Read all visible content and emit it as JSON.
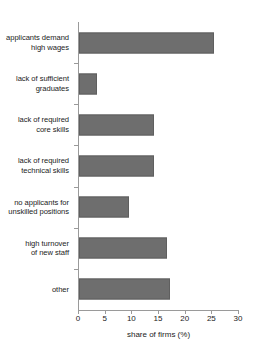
{
  "chart_data": {
    "type": "bar",
    "orientation": "horizontal",
    "title": "",
    "xlabel": "share of firms (%)",
    "ylabel": "",
    "xlim": [
      0,
      30
    ],
    "xticks": [
      0,
      5,
      10,
      15,
      20,
      25,
      30
    ],
    "xtick_labels": [
      "0",
      "5",
      "10",
      "15",
      "20",
      "25",
      "30"
    ],
    "grid": false,
    "legend": false,
    "bar_color": "#6e6e6e",
    "categories": [
      "applicants demand high wages",
      "lack of sufficient graduates",
      "lack of required core skills",
      "lack of required technical skills",
      "no applicants for unskilled positions",
      "high turnover of new staff",
      "other"
    ],
    "category_lines": [
      [
        "applicants demand",
        "high wages"
      ],
      [
        "lack of sufficient",
        "graduates"
      ],
      [
        "lack of required",
        "core skills"
      ],
      [
        "lack of required",
        "technical skills"
      ],
      [
        "no applicants for",
        "unskilled positions"
      ],
      [
        "high turnover",
        "of new staff"
      ],
      [
        "other"
      ]
    ],
    "values": [
      25.3,
      3.4,
      14.1,
      14.1,
      9.4,
      16.5,
      17.0
    ]
  }
}
